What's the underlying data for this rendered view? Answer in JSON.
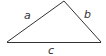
{
  "diagram": {
    "type": "triangle",
    "vertices": {
      "left": [
        7,
        42
      ],
      "apex": [
        64,
        1
      ],
      "right": [
        101,
        42
      ]
    },
    "sides": [
      {
        "name": "a",
        "label": "a",
        "from": "left",
        "to": "apex"
      },
      {
        "name": "b",
        "label": "b",
        "from": "apex",
        "to": "right"
      },
      {
        "name": "c",
        "label": "c",
        "from": "left",
        "to": "right"
      }
    ],
    "colors": {
      "stroke": "#333333",
      "background": "#ffffff"
    }
  }
}
